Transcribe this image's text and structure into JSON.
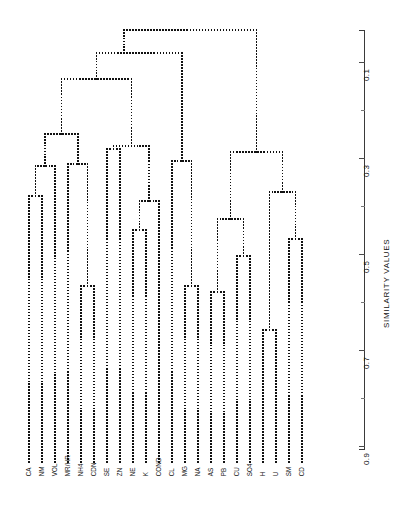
{
  "figure": {
    "kind": "dendrogram",
    "style": "dotted-lines",
    "background_color": "#ffffff",
    "line_color": "#111111"
  },
  "axis": {
    "title": "SIMILARITY VALUES",
    "orientation": "vertical-right",
    "major_ticks": [
      "0.1",
      "0.3",
      "0.5",
      "0.7",
      "0.9"
    ],
    "minor_ticks": [
      "0.2",
      "0.4",
      "0.6",
      "0.8"
    ],
    "top_value": 0.0,
    "bottom_value": 1.0
  },
  "chart_data": {
    "type": "dendrogram",
    "title": "",
    "xlabel": "",
    "ylabel": "SIMILARITY VALUES",
    "ylim": [
      0.0,
      1.0
    ],
    "y_direction": "decreasing-similarity-downward",
    "grid": false,
    "legend": "none",
    "tick_values": [
      0.1,
      0.2,
      0.3,
      0.4,
      0.5,
      0.6,
      0.7,
      0.8,
      0.9
    ],
    "tick_labels_shown": [
      "0.1",
      "0.3",
      "0.5",
      "0.7",
      "0.9"
    ],
    "leaf_count": 22,
    "leaves": [
      "CA",
      "NM",
      "VOL",
      "MR/HR",
      "NH4",
      "CDN",
      "SE",
      "ZN",
      "NE",
      "K",
      "COND",
      "CL",
      "MG",
      "NA",
      "AS",
      "PB",
      "CU",
      "SO4",
      "H",
      "U",
      "SM",
      "CD"
    ],
    "leaf_x": [
      29,
      42,
      55,
      68,
      81,
      94,
      107,
      120,
      133,
      146,
      159,
      172,
      185,
      198,
      211,
      224,
      237,
      250,
      263,
      276,
      289,
      302
    ],
    "leaf_baseline_y": 462,
    "merges": [
      {
        "id": "m1",
        "left": "CA",
        "right": "NM",
        "x": 35.5,
        "y": 196,
        "similarity": 0.38
      },
      {
        "id": "m2",
        "left": "m1",
        "right": "VOL",
        "x": 45.2,
        "y": 166,
        "similarity": 0.32
      },
      {
        "id": "m3",
        "left": "NH4",
        "right": "CDN",
        "x": 87.5,
        "y": 286,
        "similarity": 0.57
      },
      {
        "id": "m4",
        "left": "MR/HR",
        "right": "m3",
        "x": 77.8,
        "y": 164,
        "similarity": 0.31
      },
      {
        "id": "m5",
        "left": "m2",
        "right": "m4",
        "x": 61.5,
        "y": 134,
        "similarity": 0.25
      },
      {
        "id": "m6",
        "left": "SE",
        "right": "ZN",
        "x": 113.5,
        "y": 149,
        "similarity": 0.28
      },
      {
        "id": "m7",
        "left": "NE",
        "right": "K",
        "x": 139.5,
        "y": 230,
        "similarity": 0.45
      },
      {
        "id": "m8",
        "left": "m7",
        "right": "COND",
        "x": 149.2,
        "y": 201,
        "similarity": 0.39
      },
      {
        "id": "m9",
        "left": "m6",
        "right": "m8",
        "x": 131.3,
        "y": 146,
        "similarity": 0.27
      },
      {
        "id": "m10",
        "left": "m5",
        "right": "m9",
        "x": 96.4,
        "y": 79,
        "similarity": 0.14
      },
      {
        "id": "m11",
        "left": "MG",
        "right": "NA",
        "x": 191.5,
        "y": 286,
        "similarity": 0.57
      },
      {
        "id": "m12",
        "left": "CL",
        "right": "m11",
        "x": 181.7,
        "y": 161,
        "similarity": 0.31
      },
      {
        "id": "m13",
        "left": "m10",
        "right": "m12",
        "x": 124.0,
        "y": 53,
        "similarity": 0.08
      },
      {
        "id": "m14",
        "left": "AS",
        "right": "PB",
        "x": 217.5,
        "y": 292,
        "similarity": 0.58
      },
      {
        "id": "m15",
        "left": "CU",
        "right": "SO4",
        "x": 243.5,
        "y": 256,
        "similarity": 0.51
      },
      {
        "id": "m16",
        "left": "m14",
        "right": "m15",
        "x": 230.6,
        "y": 219,
        "similarity": 0.43
      },
      {
        "id": "m17",
        "left": "H",
        "right": "U",
        "x": 269.5,
        "y": 330,
        "similarity": 0.65
      },
      {
        "id": "m18",
        "left": "SM",
        "right": "CD",
        "x": 295.5,
        "y": 239,
        "similarity": 0.47
      },
      {
        "id": "m19",
        "left": "m17",
        "right": "m18",
        "x": 282.6,
        "y": 192,
        "similarity": 0.38
      },
      {
        "id": "m20",
        "left": "m16",
        "right": "m19",
        "x": 256.6,
        "y": 152,
        "similarity": 0.29
      },
      {
        "id": "m21",
        "left": "m13",
        "right": "m20",
        "x": 190.3,
        "y": 30,
        "similarity": 0.03
      }
    ]
  }
}
